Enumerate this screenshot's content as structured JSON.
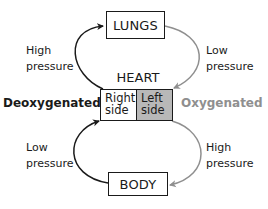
{
  "diagram": {
    "type": "circulation-cycle",
    "nodes": {
      "lungs": "LUNGS",
      "body": "BODY",
      "heart_title": "HEART",
      "heart_right": [
        "Right",
        "side"
      ],
      "heart_left": [
        "Left",
        "side"
      ]
    },
    "labels": {
      "top_left": [
        "High",
        "pressure"
      ],
      "top_right": [
        "Low",
        "pressure"
      ],
      "bottom_left": [
        "Low",
        "pressure"
      ],
      "bottom_right": [
        "High",
        "pressure"
      ],
      "deoxygenated": "Deoxygenated",
      "oxygenated": "Oxygenated"
    },
    "edges": [
      {
        "from": "heart_right",
        "to": "lungs",
        "label": "High pressure",
        "color": "#1a1a1a"
      },
      {
        "from": "lungs",
        "to": "heart_left",
        "label": "Low pressure",
        "color": "#8f8f8f"
      },
      {
        "from": "heart_left",
        "to": "body",
        "label": "High pressure",
        "color": "#8f8f8f"
      },
      {
        "from": "body",
        "to": "heart_right",
        "label": "Low pressure",
        "color": "#1a1a1a"
      }
    ],
    "colors": {
      "deoxygenated": "#1a1a1a",
      "oxygenated": "#8f8f8f",
      "heart_left_fill": "#b8b8b8"
    }
  }
}
